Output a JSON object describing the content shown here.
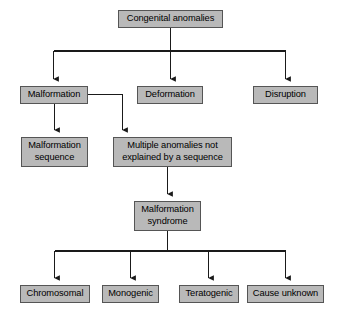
{
  "diagram": {
    "type": "flowchart",
    "background_color": "#ffffff",
    "node_fill_color": "#b9b9b9",
    "node_border_color": "#555555",
    "connector_color": "#1a1a1a",
    "text_color": "#000000",
    "nodes": [
      {
        "id": "congenital-anomalies",
        "label": "Congenital anomalies",
        "level": 1,
        "x": 118,
        "y": 10,
        "width": 105,
        "height": 18
      },
      {
        "id": "malformation",
        "label": "Malformation",
        "level": 2,
        "x": 20,
        "y": 86,
        "width": 68,
        "height": 18
      },
      {
        "id": "deformation",
        "label": "Deformation",
        "level": 2,
        "x": 137,
        "y": 86,
        "width": 66,
        "height": 18
      },
      {
        "id": "disruption",
        "label": "Disruption",
        "level": 2,
        "x": 253,
        "y": 86,
        "width": 65,
        "height": 18
      },
      {
        "id": "malformation-sequence",
        "label": "Malformation\nsequence",
        "level": 3,
        "x": 21,
        "y": 137,
        "width": 67,
        "height": 30
      },
      {
        "id": "multiple-anomalies",
        "label": "Multiple anomalies not\nexplained by a sequence",
        "level": 3,
        "x": 113,
        "y": 137,
        "width": 119,
        "height": 30
      },
      {
        "id": "malformation-syndrome",
        "label": "Malformation\nsyndrome",
        "level": 4,
        "x": 134,
        "y": 201,
        "width": 67,
        "height": 30
      },
      {
        "id": "chromosomal",
        "label": "Chromosomal",
        "level": 5,
        "x": 20,
        "y": 285,
        "width": 70,
        "height": 18
      },
      {
        "id": "monogenic",
        "label": "Monogenic",
        "level": 5,
        "x": 102,
        "y": 285,
        "width": 57,
        "height": 18
      },
      {
        "id": "teratogenic",
        "label": "Teratogenic",
        "level": 5,
        "x": 179,
        "y": 285,
        "width": 60,
        "height": 18
      },
      {
        "id": "cause-unknown",
        "label": "Cause unknown",
        "level": 5,
        "x": 247,
        "y": 285,
        "width": 77,
        "height": 18
      }
    ],
    "edges": [
      {
        "from": "congenital-anomalies",
        "to": "malformation"
      },
      {
        "from": "congenital-anomalies",
        "to": "deformation"
      },
      {
        "from": "congenital-anomalies",
        "to": "disruption"
      },
      {
        "from": "malformation",
        "to": "malformation-sequence"
      },
      {
        "from": "malformation",
        "to": "multiple-anomalies"
      },
      {
        "from": "multiple-anomalies",
        "to": "malformation-syndrome"
      },
      {
        "from": "malformation-syndrome",
        "to": "chromosomal"
      },
      {
        "from": "malformation-syndrome",
        "to": "monogenic"
      },
      {
        "from": "malformation-syndrome",
        "to": "teratogenic"
      },
      {
        "from": "malformation-syndrome",
        "to": "cause-unknown"
      }
    ]
  }
}
